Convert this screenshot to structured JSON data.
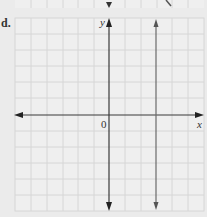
{
  "problem": {
    "label": "d.",
    "y_axis_label": "y",
    "x_axis_label": "x",
    "origin_label": "0"
  },
  "graph": {
    "grid_spacing_px": 15.8,
    "vertical_line_x_units": 3,
    "axis_color": "#3a3a3a",
    "line_color": "#6a6a6a",
    "grid_color": "#d6d6d6",
    "background": "#ebebeb"
  }
}
